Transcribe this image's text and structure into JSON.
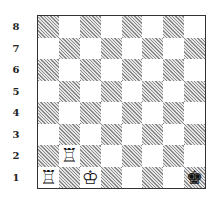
{
  "diagram": {
    "type": "chess-position",
    "ranks": [
      "8",
      "7",
      "6",
      "5",
      "4",
      "3",
      "2",
      "1"
    ],
    "files": [
      "a",
      "b",
      "c",
      "d",
      "e",
      "f",
      "g",
      "h"
    ],
    "pieces": [
      {
        "square": "a1",
        "piece": "rook",
        "color": "white",
        "glyph": "♖"
      },
      {
        "square": "b2",
        "piece": "rook",
        "color": "white",
        "glyph": "♖"
      },
      {
        "square": "c1",
        "piece": "king",
        "color": "white",
        "glyph": "♔"
      },
      {
        "square": "h1",
        "piece": "king",
        "color": "black",
        "glyph": "♚"
      }
    ],
    "colors": {
      "light_square": "#ffffff",
      "dark_square_hatch": "#8a8a8a",
      "border": "#333333"
    }
  }
}
